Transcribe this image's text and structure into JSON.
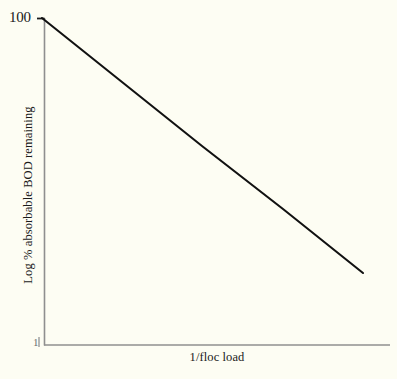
{
  "chart_data": {
    "type": "line",
    "title": "",
    "subtitle": "",
    "xlabel": "1/floc load",
    "ylabel": "Log % absorbable BOD remaining",
    "x_tick_labels": [],
    "y_tick_labels": [
      "100",
      "1"
    ],
    "y_tick_top": "100",
    "y_tick_bottom": "1",
    "grid": false,
    "legend": null,
    "legend_position": "none",
    "axis_scale_y": "log",
    "ylim": [
      1,
      100
    ],
    "xlim": [
      0,
      1
    ],
    "annotations": [],
    "series": [
      {
        "name": "absorbable BOD remaining",
        "color": "#111111",
        "line_width_px": 2,
        "x": [
          0.0,
          0.25,
          0.5,
          0.75,
          1.0
        ],
        "y": [
          100,
          42.2,
          17.8,
          7.5,
          3.16
        ],
        "x_pixels": [
          42,
          122,
          202,
          283,
          363
        ],
        "y_pixels": [
          18,
          82,
          146,
          209,
          273
        ]
      }
    ],
    "colors": {
      "background": "#fdfdf3",
      "line": "#111111",
      "axis": "#8c8c8c",
      "text": "#1a1a1a"
    }
  },
  "axes": {
    "x_axis_label": "1/floc load",
    "y_axis_label": "Log % absorbable BOD remaining",
    "y_max_tick": "100",
    "y_min_tick": "1"
  }
}
